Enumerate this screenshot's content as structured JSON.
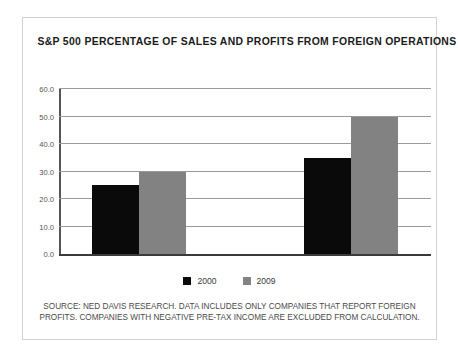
{
  "figure": {
    "title": "S&P 500 PERCENTAGE OF SALES AND PROFITS FROM FOREIGN OPERATIONS",
    "border_color": "#d2d2d2",
    "background": "#ffffff"
  },
  "legend": {
    "position": "bottom-center",
    "entries": [
      {
        "label": "2000",
        "color": "#0a0a0a",
        "swatch": "black-square-swatch"
      },
      {
        "label": "2009",
        "color": "#828282",
        "swatch": "gray-square-swatch"
      }
    ]
  },
  "source": {
    "line1": "SOURCE: NED DAVIS RESEARCH. DATA INCLUDES ONLY COMPANIES THAT REPORT FOREIGN",
    "line2": "PROFITS. COMPANIES WITH NEGATIVE PRE-TAX INCOME ARE EXCLUDED FROM CALCULATION."
  },
  "chart_data": {
    "type": "bar",
    "title": "S&P 500 PERCENTAGE OF SALES AND PROFITS FROM FOREIGN OPERATIONS",
    "xlabel": "",
    "ylabel": "",
    "ylim": [
      0.0,
      60.0
    ],
    "yticks": [
      0.0,
      10.0,
      20.0,
      30.0,
      40.0,
      50.0,
      60.0
    ],
    "ytick_labels": [
      "0.0",
      "10.0",
      "20.0",
      "30.0",
      "40.0",
      "50.0",
      "60.0"
    ],
    "grid": true,
    "categories": [
      "Sales",
      "Profits"
    ],
    "category_labels_shown": false,
    "series": [
      {
        "name": "2000",
        "color": "#0a0a0a",
        "values": [
          25.0,
          35.0
        ]
      },
      {
        "name": "2009",
        "color": "#828282",
        "values": [
          30.0,
          50.0
        ]
      }
    ]
  }
}
